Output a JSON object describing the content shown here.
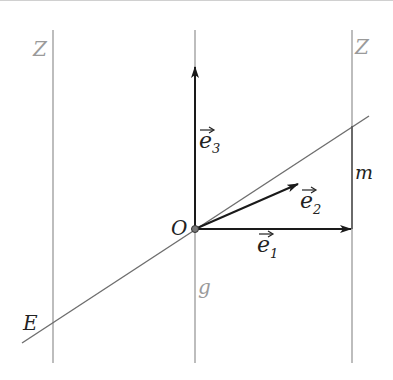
{
  "diagram": {
    "type": "geometry-vector-basis",
    "colors": {
      "background": "#ffffff",
      "line_gray": "#9a9a9a",
      "vector_dark": "#1a1a1a",
      "label_gray": "#9a9a9a",
      "label_dark": "#222222"
    },
    "labels": {
      "z_left": "Z",
      "z_right": "Z",
      "g": "g",
      "m": "m",
      "e_line": "E",
      "origin": "O",
      "e1_base": "e",
      "e1_sub": "1",
      "e2_base": "e",
      "e2_sub": "2",
      "e3_base": "e",
      "e3_sub": "3"
    },
    "elements": {
      "vertical_lines": [
        {
          "name": "Z (left)",
          "x": 53,
          "y1": 30,
          "y2": 363
        },
        {
          "name": "g (middle)",
          "x": 195,
          "y1": 30,
          "y2": 363
        },
        {
          "name": "Z (right)",
          "x": 352,
          "y1": 30,
          "y2": 363
        }
      ],
      "line_E": {
        "x1": 22,
        "y1": 343,
        "x2": 369,
        "y2": 116
      },
      "origin": {
        "x": 195,
        "y": 229
      },
      "vectors": [
        {
          "name": "e1",
          "from": [
            195,
            229
          ],
          "to": [
            352,
            229
          ]
        },
        {
          "name": "e2",
          "from": [
            195,
            229
          ],
          "to": [
            298,
            184
          ]
        },
        {
          "name": "e3",
          "from": [
            195,
            229
          ],
          "to": [
            195,
            67
          ]
        }
      ],
      "segment_m": {
        "x": 352,
        "y1": 126,
        "y2": 229
      }
    }
  }
}
